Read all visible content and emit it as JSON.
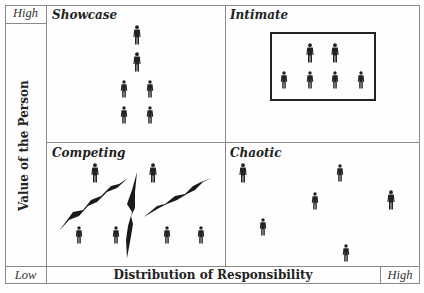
{
  "diagram": {
    "y_axis": {
      "label": "Value of the Person",
      "high": "High",
      "low": "Low"
    },
    "x_axis": {
      "label": "Distribution of Responsibility",
      "low": "Low",
      "high": "High"
    },
    "quadrants": [
      {
        "id": "showcase",
        "title": "Showcase",
        "position": "top-left",
        "people": 6
      },
      {
        "id": "intimate",
        "title": "Intimate",
        "position": "top-right",
        "people": 6,
        "grouped_in_box": true
      },
      {
        "id": "competing",
        "title": "Competing",
        "position": "bottom-left",
        "people": 6,
        "lightning_bolts": 3
      },
      {
        "id": "chaotic",
        "title": "Chaotic",
        "position": "bottom-right",
        "people": 6
      }
    ],
    "colors": {
      "line": "#8a8a8a",
      "figure": "#222222",
      "background": "#fefefe"
    }
  }
}
